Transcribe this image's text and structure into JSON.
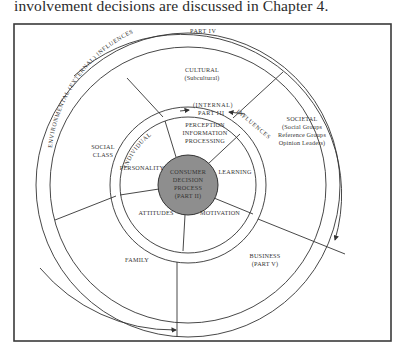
{
  "caption": "involvement decisions are discussed in Chapter 4.",
  "diagram": {
    "outer_ring": {
      "part": "PART IV",
      "label": "ENVIRONMENTAL (EXTERNAL) INFLUENCES",
      "segments": {
        "cultural": [
          "CULTURAL",
          "(Subcultural)"
        ],
        "societal": [
          "SOCIETAL",
          "(Social Groups",
          "Reference Groups",
          "Opinion Leaders)"
        ],
        "social_class": [
          "SOCIAL",
          "CLASS"
        ],
        "family": [
          "FAMILY"
        ],
        "business": [
          "BUSINESS",
          "(PART V)"
        ]
      }
    },
    "inner_ring": {
      "part": "PART III",
      "label_left": "INDIVIDUAL",
      "label_mid": "(INTERNAL)",
      "label_right": "INFLUENCES",
      "segments": {
        "perception": [
          "PERCEPTION",
          "INFORMATION",
          "PROCESSING"
        ],
        "learning": [
          "LEARNING"
        ],
        "motivation": [
          "MOTIVATION"
        ],
        "attitudes": [
          "ATTITUDES"
        ],
        "personality": [
          "PERSONALITY"
        ]
      }
    },
    "core": [
      "CONSUMER",
      "DECISION",
      "PROCESS",
      "(PART II)"
    ],
    "colors": {
      "core_fill": "#8e8e8e",
      "line": "#333333",
      "background": "#ffffff"
    }
  }
}
